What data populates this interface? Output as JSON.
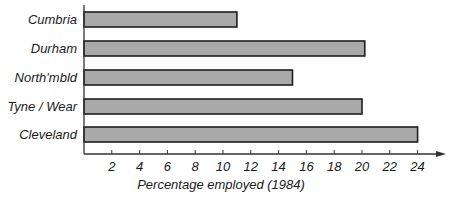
{
  "chart_data": {
    "type": "bar",
    "orientation": "horizontal",
    "title": "",
    "xlabel": "Percentage employed (1984)",
    "ylabel": "",
    "categories": [
      "Cumbria",
      "Durham",
      "North'mbld",
      "Tyne / Wear",
      "Cleveland"
    ],
    "values": [
      11,
      20.2,
      15,
      20,
      24
    ],
    "xlim": [
      0,
      25
    ],
    "xticks": [
      2,
      4,
      6,
      8,
      10,
      12,
      14,
      16,
      18,
      20,
      22,
      24
    ],
    "grid": false,
    "legend": null,
    "colors": {
      "bar_fill": "#a9a9a9",
      "bar_stroke": "#1e1e1e",
      "axis": "#333333"
    }
  }
}
